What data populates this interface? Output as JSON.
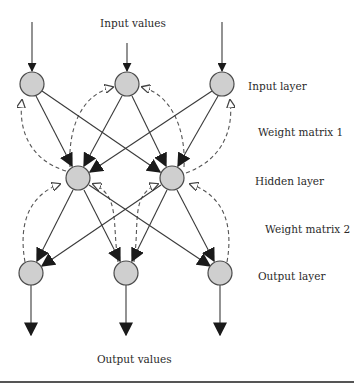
{
  "diagram": {
    "labels": {
      "input_values": "Input values",
      "input_layer": "Input layer",
      "weight_matrix_1": "Weight matrix 1",
      "hidden_layer": "Hidden layer",
      "weight_matrix_2": "Weight matrix 2",
      "output_layer": "Output layer",
      "output_values": "Output values"
    },
    "layers": [
      {
        "name": "Input layer",
        "nodes": [
          [
            32,
            84
          ],
          [
            127,
            84
          ],
          [
            222,
            84
          ]
        ]
      },
      {
        "name": "Hidden layer",
        "nodes": [
          [
            78,
            178
          ],
          [
            172,
            178
          ]
        ]
      },
      {
        "name": "Output layer",
        "nodes": [
          [
            31,
            273
          ],
          [
            126,
            273
          ],
          [
            220,
            273
          ]
        ]
      }
    ],
    "connections": {
      "feedforward": "fully connected, solid arrows with filled heads",
      "feedback": "dashed curved arrows with hollow heads from each lower-layer node back to upper-layer nodes"
    },
    "colors": {
      "node_fill": "#cfcfcf",
      "node_stroke": "#4a4a4a",
      "edge": "#3a3a3a",
      "text": "#2a2a2a"
    }
  }
}
